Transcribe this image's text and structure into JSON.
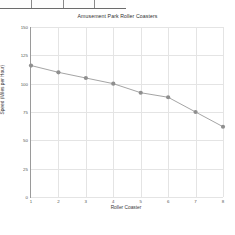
{
  "toolbar": {
    "cells": [
      "",
      "",
      "",
      ""
    ]
  },
  "chart_data": {
    "type": "line",
    "title": "Amusement Park Roller Coasters",
    "xlabel": "Roller Coaster",
    "ylabel": "Speed (Miles per Hour)",
    "categories": [
      "1",
      "2",
      "3",
      "4",
      "5",
      "6",
      "7",
      "8"
    ],
    "x": [
      1,
      2,
      3,
      4,
      5,
      6,
      7,
      8
    ],
    "values": [
      116,
      110,
      105,
      100,
      92,
      88,
      75,
      62
    ],
    "yticks": [
      0,
      25,
      50,
      75,
      100,
      125,
      150
    ],
    "ylim": [
      0,
      150
    ],
    "xlim": [
      1,
      8
    ],
    "grid": true,
    "legend": false,
    "marker_color": "#8f8f8f",
    "line_color": "#9a9a9a",
    "background": "#ffffff"
  }
}
